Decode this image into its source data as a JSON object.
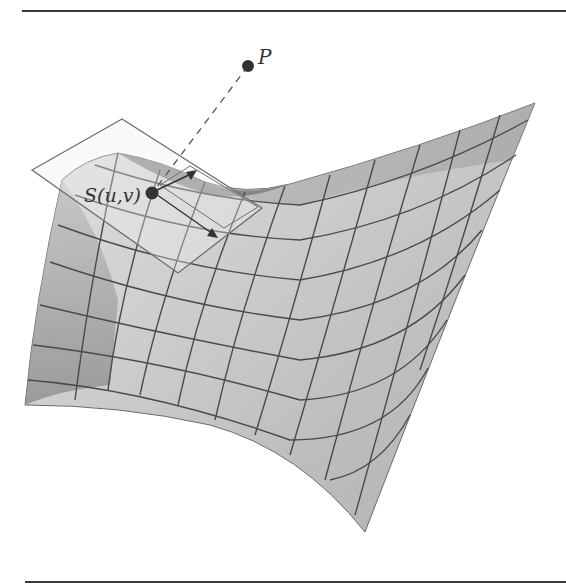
{
  "figure": {
    "labels": {
      "point": "P",
      "surface_point": "S(u,v)"
    },
    "elements": {
      "surface": "parametric saddle surface with grid lines",
      "tangent_plane": "tangent plane at S(u,v)",
      "tangent_vectors": [
        "partial derivative u",
        "partial derivative v"
      ],
      "projection_line": "dashed line from P to S(u,v)"
    },
    "colors": {
      "surface_light": "#d4d4d4",
      "surface_mid": "#b5b5b5",
      "surface_dark": "#8f8f8f",
      "grid": "#4a4a4a",
      "plane_outline": "#777777",
      "point": "#333333",
      "rule": "#3a3a3a"
    }
  }
}
